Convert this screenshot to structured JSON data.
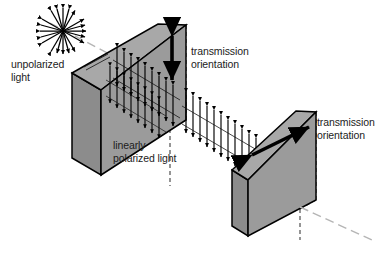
{
  "figure": {
    "background_color": "#ffffff",
    "width": 388,
    "height": 261
  },
  "labels": {
    "unpolarized_light": "unpolarized\nlight",
    "transmission_orientation_first": "transmission\norientation",
    "linearly_polarized_light": "linearly\npolarized light",
    "transmission_orientation_second": "transmission\norientation"
  },
  "colors": {
    "slab_front_face": "#9b9b9b",
    "slab_top_face": "#a8a8a8",
    "slab_side_face": "#8c8c8c",
    "outline": "#000000",
    "hidden_edge": "#4d4d4d",
    "arrow": "#000000",
    "text": "#1c1c1c",
    "ray_dashed": "#b5b5b5"
  },
  "elements": {
    "unpolarized_burst": {
      "name": "unpolarized-light-starburst",
      "description": "radial array of double-headed arrows in all orientations",
      "center_x": 63,
      "center_y": 31,
      "ray_count": 12,
      "radius": 24
    },
    "polarizer_1": {
      "name": "first-polarizing-filter",
      "transmission_axis": "vertical",
      "arrow": {
        "name": "vertical-transmission-arrow",
        "type": "double-headed",
        "x": 172,
        "y1": 33,
        "y2": 82
      }
    },
    "polarizer_2": {
      "name": "second-polarizing-filter",
      "transmission_axis": "diagonal",
      "arrow": {
        "name": "diagonal-transmission-arrow",
        "type": "double-headed",
        "x1": 249,
        "y1": 156,
        "x2": 311,
        "y2": 126
      }
    },
    "wave_field_1": {
      "name": "polarized-wave-field-between-filters",
      "orientation": "vertical double-headed arrows",
      "columns": 13
    },
    "wave_field_2": {
      "name": "polarized-wave-field-after-first-filter",
      "orientation": "vertical double-headed arrows",
      "columns": 9
    },
    "exit_ray": {
      "name": "exit-ray-dashed-line",
      "x1": 300,
      "y1": 206,
      "x2": 372,
      "y2": 240
    },
    "incident_ray": {
      "name": "incident-ray-dashed-line",
      "x1": 48,
      "y1": 22,
      "x2": 112,
      "y2": 55
    }
  }
}
